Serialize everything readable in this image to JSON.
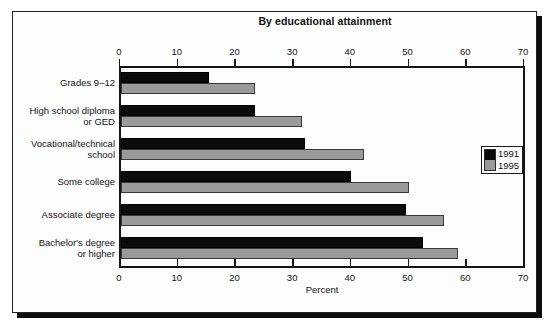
{
  "figure": {
    "title": "By educational attainment"
  },
  "chart_data": {
    "type": "bar",
    "orientation": "horizontal",
    "title": "By educational attainment",
    "xlabel": "Percent",
    "ylabel": "",
    "xlim": [
      0,
      70
    ],
    "xticks": [
      0,
      10,
      20,
      30,
      40,
      50,
      60,
      70
    ],
    "xtick_labels": [
      "0",
      "10",
      "20",
      "30",
      "40",
      "50",
      "60",
      "70"
    ],
    "grid": false,
    "axes": {
      "top_axis": true,
      "bottom_axis": true,
      "top_tick_labels": [
        "0",
        "10",
        "20",
        "30",
        "40",
        "50",
        "60",
        "70"
      ],
      "bottom_tick_labels": [
        "0",
        "10",
        "20",
        "30",
        "40",
        "50",
        "60",
        "70"
      ]
    },
    "categories": [
      "Grades 9–12",
      "High school diploma\nor GED",
      "Vocational/technical\nschool",
      "Some college",
      "Associate degree",
      "Bachelor's degree\nor higher"
    ],
    "series": [
      {
        "name": "1991",
        "color": "#0b0b0b",
        "values": [
          15.3,
          23.3,
          32.0,
          40.0,
          49.5,
          52.4
        ]
      },
      {
        "name": "1995",
        "color": "#9a9a9a",
        "values": [
          23.3,
          31.4,
          42.2,
          50.0,
          56.0,
          58.4
        ]
      }
    ],
    "legend": {
      "position": "right",
      "entries": [
        {
          "label": "1991",
          "color": "#0b0b0b"
        },
        {
          "label": "1995",
          "color": "#9a9a9a"
        }
      ]
    }
  }
}
